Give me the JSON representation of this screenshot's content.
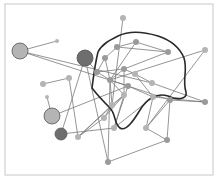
{
  "diagram": {
    "type": "network-graph",
    "frame": {
      "x": 5,
      "y": 4,
      "w": 208,
      "h": 171,
      "stroke": "#c8c8c8"
    },
    "colors": {
      "edge": "#7a7a7a",
      "boundary": "#2a2a2a",
      "node_light": "#b4b4b4",
      "node_mid": "#9a9a9a",
      "node_dark": "#6e6e6e"
    },
    "nodes": [
      {
        "id": "n1",
        "x": 20,
        "y": 51,
        "r": 8,
        "shade": "light"
      },
      {
        "id": "n2",
        "x": 57,
        "y": 41,
        "r": 2,
        "shade": "light"
      },
      {
        "id": "n3",
        "x": 85,
        "y": 58,
        "r": 8,
        "shade": "dark"
      },
      {
        "id": "n4",
        "x": 69,
        "y": 78,
        "r": 3,
        "shade": "light"
      },
      {
        "id": "n5",
        "x": 43,
        "y": 84,
        "r": 3,
        "shade": "light"
      },
      {
        "id": "n6",
        "x": 47,
        "y": 97,
        "r": 2,
        "shade": "light"
      },
      {
        "id": "n7",
        "x": 52,
        "y": 116,
        "r": 8,
        "shade": "light"
      },
      {
        "id": "n8",
        "x": 61,
        "y": 134,
        "r": 6,
        "shade": "dark"
      },
      {
        "id": "n9",
        "x": 78,
        "y": 137,
        "r": 3,
        "shade": "light"
      },
      {
        "id": "n10",
        "x": 123,
        "y": 18,
        "r": 3,
        "shade": "light"
      },
      {
        "id": "n11",
        "x": 117,
        "y": 47,
        "r": 3,
        "shade": "mid"
      },
      {
        "id": "n12",
        "x": 136,
        "y": 42,
        "r": 3,
        "shade": "mid"
      },
      {
        "id": "n13",
        "x": 168,
        "y": 52,
        "r": 3,
        "shade": "mid"
      },
      {
        "id": "n14",
        "x": 205,
        "y": 50,
        "r": 3,
        "shade": "light"
      },
      {
        "id": "n15",
        "x": 105,
        "y": 58,
        "r": 3,
        "shade": "mid"
      },
      {
        "id": "n16",
        "x": 97,
        "y": 72,
        "r": 3,
        "shade": "mid"
      },
      {
        "id": "n17",
        "x": 124,
        "y": 69,
        "r": 3,
        "shade": "mid"
      },
      {
        "id": "n18",
        "x": 135,
        "y": 74,
        "r": 3,
        "shade": "light"
      },
      {
        "id": "n19",
        "x": 110,
        "y": 80,
        "r": 3,
        "shade": "mid"
      },
      {
        "id": "n20",
        "x": 128,
        "y": 86,
        "r": 3,
        "shade": "mid"
      },
      {
        "id": "n21",
        "x": 152,
        "y": 83,
        "r": 3,
        "shade": "light"
      },
      {
        "id": "n22",
        "x": 124,
        "y": 95,
        "r": 3,
        "shade": "light"
      },
      {
        "id": "n23",
        "x": 153,
        "y": 97,
        "r": 3,
        "shade": "light"
      },
      {
        "id": "n24",
        "x": 170,
        "y": 100,
        "r": 3,
        "shade": "mid"
      },
      {
        "id": "n25",
        "x": 205,
        "y": 102,
        "r": 3,
        "shade": "mid"
      },
      {
        "id": "n26",
        "x": 112,
        "y": 105,
        "r": 3,
        "shade": "light"
      },
      {
        "id": "n27",
        "x": 104,
        "y": 118,
        "r": 3,
        "shade": "light"
      },
      {
        "id": "n28",
        "x": 146,
        "y": 128,
        "r": 3,
        "shade": "light"
      },
      {
        "id": "n29",
        "x": 114,
        "y": 128,
        "r": 3,
        "shade": "light"
      },
      {
        "id": "n30",
        "x": 167,
        "y": 140,
        "r": 3,
        "shade": "mid"
      },
      {
        "id": "n31",
        "x": 108,
        "y": 162,
        "r": 3,
        "shade": "mid"
      }
    ],
    "edges": [
      [
        "n1",
        "n2"
      ],
      [
        "n1",
        "n21"
      ],
      [
        "n1",
        "n20"
      ],
      [
        "n5",
        "n4"
      ],
      [
        "n4",
        "n9"
      ],
      [
        "n6",
        "n7"
      ],
      [
        "n7",
        "n20"
      ],
      [
        "n3",
        "n8"
      ],
      [
        "n3",
        "n16"
      ],
      [
        "n10",
        "n26"
      ],
      [
        "n11",
        "n12"
      ],
      [
        "n11",
        "n13"
      ],
      [
        "n12",
        "n13"
      ],
      [
        "n11",
        "n15"
      ],
      [
        "n12",
        "n19"
      ],
      [
        "n15",
        "n16"
      ],
      [
        "n15",
        "n19"
      ],
      [
        "n16",
        "n19"
      ],
      [
        "n16",
        "n17"
      ],
      [
        "n17",
        "n18"
      ],
      [
        "n17",
        "n19"
      ],
      [
        "n19",
        "n20"
      ],
      [
        "n19",
        "n22"
      ],
      [
        "n19",
        "n26"
      ],
      [
        "n17",
        "n22"
      ],
      [
        "n18",
        "n21"
      ],
      [
        "n18",
        "n23"
      ],
      [
        "n14",
        "n19"
      ],
      [
        "n14",
        "n28"
      ],
      [
        "n13",
        "n17"
      ],
      [
        "n20",
        "n23"
      ],
      [
        "n20",
        "n24"
      ],
      [
        "n21",
        "n25"
      ],
      [
        "n23",
        "n25"
      ],
      [
        "n24",
        "n25"
      ],
      [
        "n22",
        "n26"
      ],
      [
        "n22",
        "n27"
      ],
      [
        "n22",
        "n29"
      ],
      [
        "n23",
        "n28"
      ],
      [
        "n24",
        "n28"
      ],
      [
        "n26",
        "n27"
      ],
      [
        "n20",
        "n29"
      ],
      [
        "n28",
        "n30"
      ],
      [
        "n24",
        "n30"
      ],
      [
        "n30",
        "n31"
      ],
      [
        "n9",
        "n22"
      ],
      [
        "n9",
        "n26"
      ],
      [
        "n27",
        "n9"
      ],
      [
        "n31",
        "n19"
      ],
      [
        "n31",
        "n3"
      ],
      [
        "n8",
        "n29"
      ],
      [
        "n23",
        "n29"
      ]
    ],
    "boundary_path": "M 92 88 C 94 72, 96 60, 98 52 C 102 44, 110 40, 118 36 C 130 30, 145 32, 158 36 C 170 40, 180 48, 184 58 C 188 70, 182 80, 186 92 C 188 100, 176 100, 168 96 C 156 92, 146 100, 140 110 C 134 120, 126 132, 120 128 C 114 124, 116 114, 110 108 C 104 102, 98 96, 92 88 Z"
  }
}
